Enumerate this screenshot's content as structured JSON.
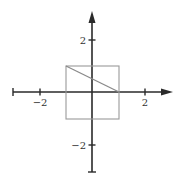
{
  "diagram": {
    "type": "coordinate-plane",
    "x_axis": {
      "ticks": [
        -2,
        2
      ],
      "labels": [
        "−2",
        "2"
      ],
      "range": [
        -3,
        3
      ]
    },
    "y_axis": {
      "ticks": [
        2,
        -2
      ],
      "labels": [
        "2",
        "−2"
      ],
      "range": [
        -3,
        3
      ]
    },
    "square": {
      "corners": [
        [
          -1,
          1
        ],
        [
          1,
          1
        ],
        [
          1,
          -1
        ],
        [
          -1,
          -1
        ]
      ],
      "color": "#9a9a9a"
    },
    "segment": {
      "from": [
        -1,
        1
      ],
      "to": [
        1,
        0
      ],
      "color": "#8a8a8a"
    },
    "axis_color": "#2a2a2a"
  }
}
